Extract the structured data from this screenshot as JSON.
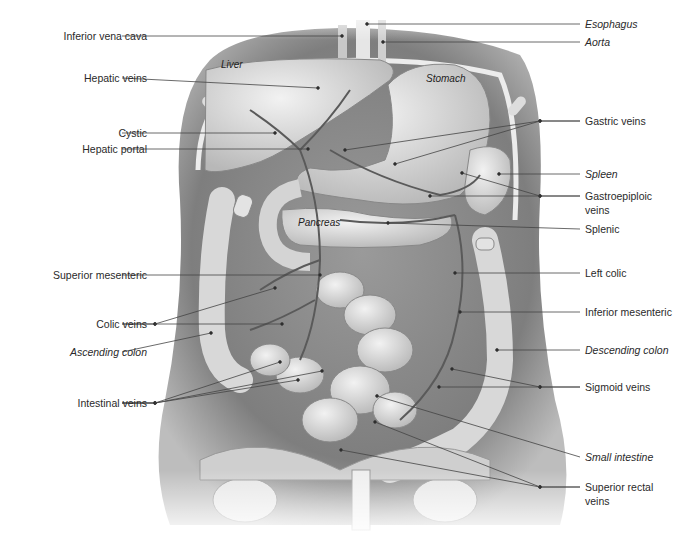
{
  "diagram": {
    "left_labels": [
      {
        "text": "Inferior vena cava",
        "italic": false,
        "y": 36,
        "targets": [
          [
            342,
            36
          ]
        ]
      },
      {
        "text": "Hepatic veins",
        "italic": false,
        "y": 78,
        "targets": [
          [
            318,
            88
          ]
        ]
      },
      {
        "text": "Cystic",
        "italic": false,
        "y": 133,
        "targets": [
          [
            275,
            133
          ]
        ]
      },
      {
        "text": "Hepatic portal",
        "italic": false,
        "y": 149,
        "targets": [
          [
            308,
            149
          ]
        ]
      },
      {
        "text": "Superior mesenteric",
        "italic": false,
        "y": 275,
        "targets": [
          [
            320,
            275
          ]
        ]
      },
      {
        "text": "Colic veins",
        "italic": false,
        "y": 324,
        "targets": [
          [
            275,
            288
          ],
          [
            282,
            324
          ]
        ]
      },
      {
        "text": "Ascending colon",
        "italic": false,
        "italic_flag": true,
        "y": 352,
        "targets": [
          [
            211,
            333
          ]
        ]
      },
      {
        "text": "Intestinal veins",
        "italic": false,
        "y": 403,
        "targets": [
          [
            280,
            362
          ],
          [
            298,
            380
          ],
          [
            322,
            371
          ]
        ]
      }
    ],
    "right_labels": [
      {
        "text": "Esophagus",
        "italic": true,
        "y": 24,
        "targets": [
          [
            367,
            24
          ]
        ]
      },
      {
        "text": "Aorta",
        "italic": true,
        "y": 42,
        "targets": [
          [
            383,
            42
          ]
        ]
      },
      {
        "text": "Gastric veins",
        "italic": false,
        "y": 121,
        "targets": [
          [
            345,
            150
          ],
          [
            395,
            164
          ]
        ]
      },
      {
        "text": "Spleen",
        "italic": true,
        "y": 174,
        "targets": [
          [
            499,
            174
          ]
        ]
      },
      {
        "text": "Gastroepiploic veins",
        "italic": false,
        "y": 196,
        "lines": [
          "Gastroepiploic",
          "veins"
        ],
        "targets": [
          [
            462,
            173
          ],
          [
            430,
            196
          ]
        ]
      },
      {
        "text": "Splenic",
        "italic": false,
        "y": 229,
        "targets": [
          [
            388,
            223
          ]
        ]
      },
      {
        "text": "Left colic",
        "italic": false,
        "y": 273,
        "targets": [
          [
            455,
            273
          ]
        ]
      },
      {
        "text": "Inferior mesenteric",
        "italic": false,
        "y": 312,
        "targets": [
          [
            460,
            312
          ]
        ]
      },
      {
        "text": "Descending colon",
        "italic": true,
        "y": 350,
        "targets": [
          [
            497,
            350
          ]
        ]
      },
      {
        "text": "Sigmoid veins",
        "italic": false,
        "y": 387,
        "targets": [
          [
            452,
            369
          ],
          [
            439,
            387
          ]
        ]
      },
      {
        "text": "Small intestine",
        "italic": true,
        "y": 457,
        "targets": [
          [
            377,
            396
          ]
        ]
      },
      {
        "text": "Superior rectal veins",
        "italic": false,
        "y": 487,
        "lines": [
          "Superior rectal",
          "veins"
        ],
        "targets": [
          [
            375,
            422
          ],
          [
            341,
            450
          ]
        ]
      }
    ],
    "organ_labels": [
      {
        "text": "Liver",
        "x": 221,
        "y": 66
      },
      {
        "text": "Stomach",
        "x": 426,
        "y": 80
      },
      {
        "text": "Pancreas",
        "x": 298,
        "y": 224
      }
    ],
    "colors": {
      "label_text": "#2a2a2a",
      "leader_line": "#444444",
      "body_shadow": "#8c8c8c",
      "organ_fill": "#d9d9d9",
      "vein": "#5a5a5a"
    }
  }
}
